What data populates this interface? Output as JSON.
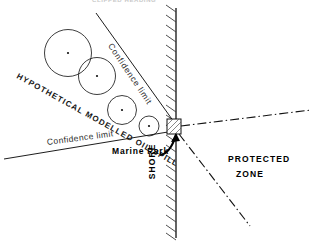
{
  "figure": {
    "width": 313,
    "height": 246,
    "background": "#ffffff",
    "ink": "#111111"
  },
  "labels": {
    "top_clipped": "CLIPPED HEADING",
    "confidence_limit_upper": "Confidence limit",
    "confidence_limit_lower": "Confidence limit",
    "oil_spill": "HYPOTHETICAL MODELLED OIL SPILL",
    "marine_park": "Marine Park",
    "shore": "SHORE",
    "protected": "PROTECTED",
    "zone": "ZONE"
  },
  "diagram": {
    "spill_circles": [
      {
        "cx": 68,
        "cy": 53,
        "r": 23.5
      },
      {
        "cx": 97,
        "cy": 76,
        "r": 18.5
      },
      {
        "cx": 122,
        "cy": 110,
        "r": 14.5
      },
      {
        "cx": 149,
        "cy": 126,
        "r": 10.0
      }
    ],
    "shoreline": {
      "x": 176,
      "y1": 8,
      "y2": 238,
      "hatch_side": "left",
      "hatch_count": 24
    },
    "marine_park_box": {
      "x": 167,
      "y": 119,
      "w": 14,
      "h": 15
    },
    "confidence_line_upper": {
      "x1": 96,
      "y1": 13,
      "x2": 174,
      "y2": 122
    },
    "confidence_line_lower": {
      "x1": 4,
      "y1": 159,
      "x2": 174,
      "y2": 131
    },
    "protected_boundary_upper": {
      "x1": 181,
      "y1": 126,
      "x2": 311,
      "y2": 110
    },
    "protected_boundary_lower": {
      "x1": 179,
      "y1": 134,
      "x2": 250,
      "y2": 226
    },
    "arrow": {
      "from_x": 162,
      "from_y": 154,
      "to_x": 176,
      "to_y": 134
    }
  }
}
